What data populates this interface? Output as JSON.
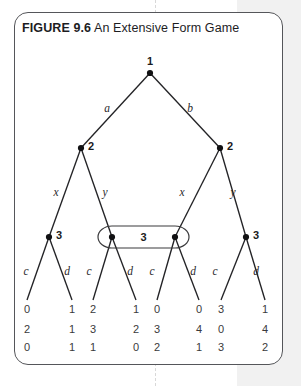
{
  "figure": {
    "label": "FIGURE 9.6",
    "caption": "An Extensive Form Game"
  },
  "colors": {
    "ink": "#232326",
    "frame": "#55565a",
    "page_band": "#f1f1f1",
    "payoff_text": "#3a3a3c"
  },
  "chart_data": {
    "type": "diagram",
    "title": "An Extensive Form Game",
    "diagram_kind": "extensive-form game tree",
    "players": [
      "1",
      "2",
      "3"
    ],
    "nodes": [
      {
        "id": "root",
        "player": "1",
        "x": 150,
        "y": 73,
        "label": "1",
        "label_pos": "above"
      },
      {
        "id": "n2L",
        "player": "2",
        "x": 81,
        "y": 148,
        "label": "2",
        "label_pos": "right"
      },
      {
        "id": "n2R",
        "player": "2",
        "x": 220,
        "y": 148,
        "label": "2",
        "label_pos": "right"
      },
      {
        "id": "n3a",
        "player": "3",
        "x": 49,
        "y": 237,
        "label": "3",
        "label_pos": "right"
      },
      {
        "id": "n3b",
        "player": "3",
        "x": 112,
        "y": 237,
        "label": "",
        "label_pos": "none"
      },
      {
        "id": "n3c",
        "player": "3",
        "x": 175,
        "y": 237,
        "label": "",
        "label_pos": "none"
      },
      {
        "id": "n3d",
        "player": "3",
        "x": 246,
        "y": 237,
        "label": "3",
        "label_pos": "right"
      }
    ],
    "information_set": {
      "player": "3",
      "label": "3",
      "members": [
        "n3b",
        "n3c"
      ],
      "x1": 112,
      "x2": 175,
      "y": 237,
      "rx": 14,
      "ry": 11
    },
    "edges": [
      {
        "from": "root",
        "to": "n2L",
        "action": "a",
        "label_x": 107,
        "label_y": 112
      },
      {
        "from": "root",
        "to": "n2R",
        "action": "b",
        "label_x": 190,
        "label_y": 112
      },
      {
        "from": "n2L",
        "to": "n3a",
        "action": "x",
        "label_x": 56,
        "label_y": 196
      },
      {
        "from": "n2L",
        "to": "n3b",
        "action": "y",
        "label_x": 105,
        "label_y": 196
      },
      {
        "from": "n2R",
        "to": "n3c",
        "action": "x",
        "label_x": 182,
        "label_y": 196
      },
      {
        "from": "n2R",
        "to": "n3d",
        "action": "y",
        "label_x": 233,
        "label_y": 196
      },
      {
        "from": "n3a",
        "to": "t1",
        "action": "c",
        "label_x": 26,
        "label_y": 275
      },
      {
        "from": "n3a",
        "to": "t2",
        "action": "d",
        "label_x": 67,
        "label_y": 275
      },
      {
        "from": "n3b",
        "to": "t3",
        "action": "c",
        "label_x": 89,
        "label_y": 275
      },
      {
        "from": "n3b",
        "to": "t4",
        "action": "d",
        "label_x": 130,
        "label_y": 275
      },
      {
        "from": "n3c",
        "to": "t5",
        "action": "c",
        "label_x": 152,
        "label_y": 275
      },
      {
        "from": "n3c",
        "to": "t6",
        "action": "d",
        "label_x": 193,
        "label_y": 275
      },
      {
        "from": "n3d",
        "to": "t7",
        "action": "c",
        "label_x": 215,
        "label_y": 275
      },
      {
        "from": "n3d",
        "to": "t8",
        "action": "d",
        "label_x": 256,
        "label_y": 275
      }
    ],
    "action_sets": {
      "player_1": [
        "a",
        "b"
      ],
      "player_2": [
        "x",
        "y"
      ],
      "player_3": [
        "c",
        "d"
      ]
    },
    "terminal_nodes": [
      {
        "id": "t1",
        "x": 27,
        "payoffs": [
          0,
          2,
          0
        ]
      },
      {
        "id": "t2",
        "x": 72,
        "payoffs": [
          1,
          1,
          1
        ]
      },
      {
        "id": "t3",
        "x": 93,
        "payoffs": [
          2,
          3,
          1
        ]
      },
      {
        "id": "t4",
        "x": 136,
        "payoffs": [
          1,
          2,
          0
        ]
      },
      {
        "id": "t5",
        "x": 157,
        "payoffs": [
          0,
          3,
          2
        ]
      },
      {
        "id": "t6",
        "x": 199,
        "payoffs": [
          0,
          4,
          1
        ]
      },
      {
        "id": "t7",
        "x": 221,
        "payoffs": [
          3,
          0,
          3
        ]
      },
      {
        "id": "t8",
        "x": 265,
        "payoffs": [
          1,
          4,
          2
        ]
      }
    ],
    "payoff_rows_y": [
      313,
      333,
      351
    ],
    "payoff_row_labels": [
      "player 1 payoff",
      "player 2 payoff",
      "player 3 payoff"
    ]
  }
}
